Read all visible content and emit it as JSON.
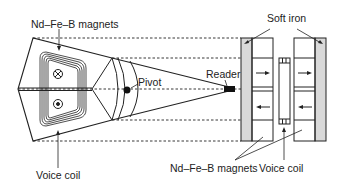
{
  "diagram": {
    "type": "hard-disk-actuator",
    "labels": {
      "magnets_top": "Nd–Fe–B magnets",
      "pivot": "Pivot",
      "reader": "Reader",
      "soft_iron": "Soft iron",
      "voice_coil_left": "Voice coil",
      "magnets_bottom": "Nd–Fe–B magnets",
      "voice_coil_right": "Voice coil"
    },
    "symbols": {
      "current_into_page": "⊗",
      "current_out_of_page": "⊙"
    },
    "colors": {
      "line": "#222222",
      "soft_iron_fill": "#d9d9d9",
      "background": "#ffffff"
    }
  }
}
